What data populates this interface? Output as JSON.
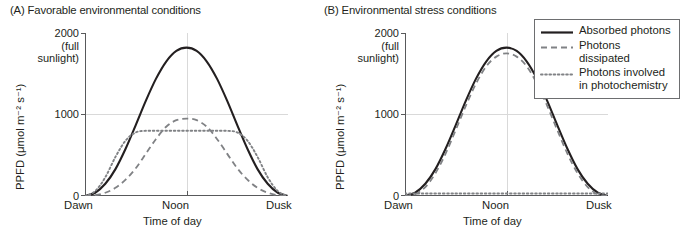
{
  "figure": {
    "panels": [
      {
        "id": "A",
        "title": "(A)  Favorable environmental conditions",
        "y_axis": {
          "label": "PPFD (μmol m⁻² s⁻¹)",
          "ticks": [
            "2000\n(full\nsunlight)",
            "1000",
            "0"
          ],
          "tick_2000": "2000",
          "tick_2000_sub1": "(full",
          "tick_2000_sub2": "sunlight)",
          "tick_1000": "1000",
          "tick_0": "0"
        },
        "x_axis": {
          "label": "Time of day",
          "ticks": [
            "Dawn",
            "Noon",
            "Dusk"
          ],
          "tick_dawn": "Dawn",
          "tick_noon": "Noon",
          "tick_dusk": "Dusk"
        }
      },
      {
        "id": "B",
        "title": "(B)  Environmental stress conditions",
        "y_axis": {
          "label": "PPFD (μmol m⁻² s⁻¹)",
          "tick_2000": "2000",
          "tick_2000_sub1": "(full",
          "tick_2000_sub2": "sunlight)",
          "tick_1000": "1000",
          "tick_0": "0"
        },
        "x_axis": {
          "label": "Time of day",
          "tick_dawn": "Dawn",
          "tick_noon": "Noon",
          "tick_dusk": "Dusk"
        }
      }
    ],
    "legend": {
      "items": [
        {
          "label": "Absorbed photons",
          "style": "solid",
          "color": "#231f20"
        },
        {
          "label": "Photons dissipated",
          "style": "dashed",
          "color": "#808285"
        },
        {
          "label": "Photons involved\nin photochemistry",
          "style": "dotted",
          "color": "#808285"
        }
      ]
    }
  },
  "chart_data": [
    {
      "type": "line",
      "title": "(A)  Favorable environmental conditions",
      "xlabel": "Time of day",
      "ylabel": "PPFD (μmol m⁻² s⁻¹)",
      "xlim": [
        0,
        1
      ],
      "ylim": [
        0,
        2000
      ],
      "yticks": [
        0,
        1000,
        2000
      ],
      "ytick_labels": [
        "0",
        "1000",
        "2000 (full sunlight)"
      ],
      "xticks": [
        0,
        0.5,
        1
      ],
      "xtick_labels": [
        "Dawn",
        "Noon",
        "Dusk"
      ],
      "grid": true,
      "legend_position": "outside-right",
      "series": [
        {
          "name": "Absorbed photons",
          "style": "solid",
          "color": "#231f20",
          "x": [
            0,
            0.05,
            0.1,
            0.15,
            0.2,
            0.25,
            0.3,
            0.35,
            0.4,
            0.45,
            0.5,
            0.55,
            0.6,
            0.65,
            0.7,
            0.75,
            0.8,
            0.85,
            0.9,
            0.95,
            1
          ],
          "y": [
            0,
            40,
            150,
            330,
            580,
            870,
            1170,
            1440,
            1650,
            1780,
            1820,
            1780,
            1650,
            1440,
            1170,
            870,
            580,
            330,
            150,
            40,
            0
          ]
        },
        {
          "name": "Photons dissipated",
          "style": "dashed",
          "color": "#808285",
          "x": [
            0,
            0.05,
            0.1,
            0.15,
            0.2,
            0.25,
            0.3,
            0.35,
            0.4,
            0.45,
            0.5,
            0.55,
            0.6,
            0.65,
            0.7,
            0.75,
            0.8,
            0.85,
            0.9,
            0.95,
            1
          ],
          "y": [
            0,
            10,
            40,
            100,
            200,
            340,
            520,
            700,
            850,
            930,
            950,
            930,
            850,
            700,
            520,
            340,
            200,
            100,
            40,
            10,
            0
          ]
        },
        {
          "name": "Photons involved in photochemistry",
          "style": "dotted",
          "color": "#808285",
          "x": [
            0,
            0.05,
            0.1,
            0.15,
            0.2,
            0.25,
            0.3,
            0.35,
            0.4,
            0.45,
            0.5,
            0.55,
            0.6,
            0.65,
            0.7,
            0.75,
            0.8,
            0.85,
            0.9,
            0.95,
            1
          ],
          "y": [
            0,
            60,
            230,
            480,
            680,
            780,
            800,
            800,
            800,
            800,
            800,
            800,
            800,
            800,
            800,
            780,
            680,
            480,
            230,
            60,
            0
          ]
        }
      ]
    },
    {
      "type": "line",
      "title": "(B)  Environmental stress conditions",
      "xlabel": "Time of day",
      "ylabel": "PPFD (μmol m⁻² s⁻¹)",
      "xlim": [
        0,
        1
      ],
      "ylim": [
        0,
        2000
      ],
      "yticks": [
        0,
        1000,
        2000
      ],
      "ytick_labels": [
        "0",
        "1000",
        "2000 (full sunlight)"
      ],
      "xticks": [
        0,
        0.5,
        1
      ],
      "xtick_labels": [
        "Dawn",
        "Noon",
        "Dusk"
      ],
      "grid": true,
      "legend_position": "outside-right",
      "series": [
        {
          "name": "Absorbed photons",
          "style": "solid",
          "color": "#231f20",
          "x": [
            0,
            0.05,
            0.1,
            0.15,
            0.2,
            0.25,
            0.3,
            0.35,
            0.4,
            0.45,
            0.5,
            0.55,
            0.6,
            0.65,
            0.7,
            0.75,
            0.8,
            0.85,
            0.9,
            0.95,
            1
          ],
          "y": [
            0,
            40,
            150,
            330,
            580,
            870,
            1170,
            1440,
            1650,
            1780,
            1820,
            1780,
            1650,
            1440,
            1170,
            870,
            580,
            330,
            150,
            40,
            0
          ]
        },
        {
          "name": "Photons dissipated",
          "style": "dashed",
          "color": "#808285",
          "x": [
            0,
            0.05,
            0.1,
            0.15,
            0.2,
            0.25,
            0.3,
            0.35,
            0.4,
            0.45,
            0.5,
            0.55,
            0.6,
            0.65,
            0.7,
            0.75,
            0.8,
            0.85,
            0.9,
            0.95,
            1
          ],
          "y": [
            0,
            20,
            110,
            280,
            520,
            810,
            1110,
            1380,
            1590,
            1710,
            1750,
            1710,
            1590,
            1380,
            1110,
            810,
            520,
            280,
            110,
            20,
            0
          ]
        },
        {
          "name": "Photons involved in photochemistry",
          "style": "dotted",
          "color": "#808285",
          "x": [
            0,
            0.25,
            0.5,
            0.75,
            1
          ],
          "y": [
            30,
            30,
            30,
            30,
            30
          ]
        }
      ]
    }
  ]
}
